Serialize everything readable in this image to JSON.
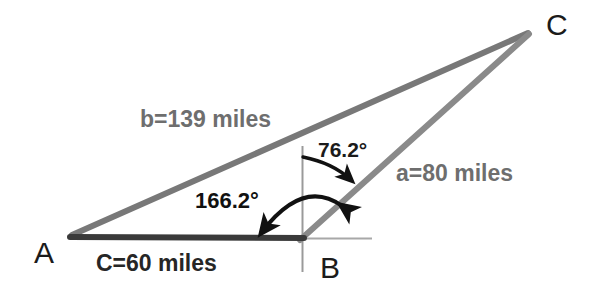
{
  "figure": {
    "type": "geometry-triangle-diagram",
    "background_color": "#ffffff",
    "vertices": [
      {
        "name": "A",
        "label": "A",
        "x": 72,
        "y": 236,
        "label_x": 34,
        "label_y": 238
      },
      {
        "name": "B",
        "label": "B",
        "x": 302,
        "y": 238,
        "label_x": 320,
        "label_y": 253
      },
      {
        "name": "C",
        "label": "C",
        "x": 528,
        "y": 32,
        "label_x": 546,
        "label_y": 10
      }
    ],
    "sides": [
      {
        "name": "side-b",
        "label": "b=139 miles",
        "from": "A",
        "to": "C",
        "length_value": 139,
        "units": "miles",
        "color": "#787878",
        "label_x": 140,
        "label_y": 108
      },
      {
        "name": "side-a",
        "label": "a=80 miles",
        "from": "B",
        "to": "C",
        "length_value": 80,
        "units": "miles",
        "color": "#8a8a8a",
        "label_x": 396,
        "label_y": 162
      },
      {
        "name": "side-C",
        "label": "C=60 miles",
        "from": "A",
        "to": "B",
        "length_value": 60,
        "units": "miles",
        "color": "#3a3a3a",
        "label_x": 96,
        "label_y": 252
      }
    ],
    "angles": [
      {
        "name": "bearing-angle-upper",
        "label": "76.2°",
        "value": 76.2,
        "units": "degrees",
        "from_ray": "north-vertical",
        "to_ray": "side-a",
        "arrow_style": "single",
        "color": "#1b1b1b",
        "label_x": 318,
        "label_y": 139
      },
      {
        "name": "bearing-angle-lower",
        "label": "166.2°",
        "value": 166.2,
        "units": "degrees",
        "from_ray": "side-a",
        "to_ray": "side-C",
        "arrow_style": "double",
        "color": "#111111",
        "label_x": 195,
        "label_y": 190
      }
    ],
    "reference_lines": [
      {
        "name": "vertical-reference-line",
        "orientation": "vertical",
        "color": "#9a9a9a",
        "x": 302,
        "y1": 146,
        "y2": 272
      },
      {
        "name": "horizontal-reference-line",
        "orientation": "horizontal",
        "color": "#a8a8a8",
        "x1": 302,
        "x2": 372,
        "y": 238
      }
    ]
  }
}
